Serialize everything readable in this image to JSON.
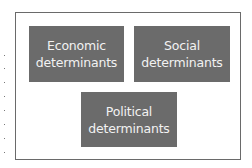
{
  "diagram": {
    "boxes": [
      {
        "line1": "Economic",
        "line2": "determinants"
      },
      {
        "line1": "Social",
        "line2": "determinants"
      },
      {
        "line1": "Political",
        "line2": "determinants"
      }
    ],
    "colors": {
      "box_fill": "#6b6b6b",
      "box_text": "#f2f2f2",
      "frame_border": "#6a6a6a",
      "background": "#ffffff"
    }
  }
}
